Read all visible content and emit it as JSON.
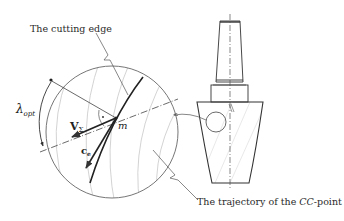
{
  "diagram": {
    "type": "technical-illustration",
    "labels": {
      "cutting_edge": "The cutting edge",
      "trajectory_prefix": "The trajectory of the ",
      "trajectory_italic": "CC",
      "trajectory_suffix": "-point",
      "lambda_base": "λ",
      "lambda_sub": "opt",
      "v_base": "V",
      "v_sub": "Σ",
      "c_base": "c",
      "c_sub": "e",
      "point_m": "m"
    },
    "colors": {
      "line": "#333333",
      "thin_line": "#777777",
      "hatch": "#c8c8c8"
    }
  }
}
